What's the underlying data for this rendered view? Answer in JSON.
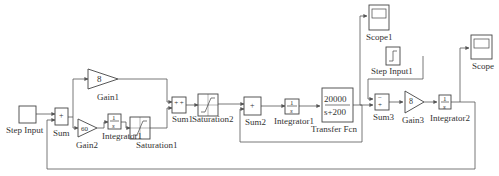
{
  "blocks": {
    "step_input": {
      "label": "Step Input"
    },
    "sum": {
      "label": "Sum",
      "signs": "+"
    },
    "gain1": {
      "label": "Gain1",
      "value": "8"
    },
    "gain2": {
      "label": "Gain2",
      "value": "60"
    },
    "integrator1a": {
      "label": "Integrator1",
      "num": "1",
      "den": "s"
    },
    "saturation1": {
      "label": "Saturation1"
    },
    "sum1": {
      "label": "Sum1",
      "signs": "+ +"
    },
    "saturation2": {
      "label": "Saturation2"
    },
    "sum2": {
      "label": "Sum2",
      "signs": "+"
    },
    "integrator1b": {
      "label": "Integrator1",
      "num": "1",
      "den": "s"
    },
    "transfer_fcn": {
      "label": "Transfer Fcn",
      "num": "20000",
      "den": "s+200"
    },
    "scope1": {
      "label": "Scope1"
    },
    "step_input1": {
      "label": "Step Input1"
    },
    "sum3": {
      "label": "Sum3",
      "signs": "− +"
    },
    "gain3": {
      "label": "Gain3",
      "value": "8"
    },
    "integrator2": {
      "label": "Integrator2",
      "num": "1",
      "den": "s"
    },
    "scope": {
      "label": "Scope"
    }
  },
  "colors": {
    "line": "#555555",
    "block": "#444444",
    "background": "#ffffff"
  }
}
